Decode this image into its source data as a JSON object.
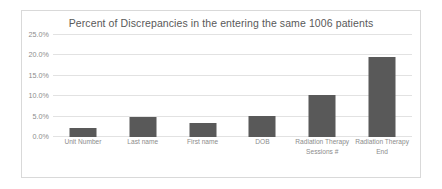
{
  "chart_data": {
    "type": "bar",
    "title": "Percent of Discrepancies in the entering the same 1006 patients",
    "xlabel": "",
    "ylabel": "",
    "categories": [
      "Unit Number",
      "Last name",
      "First name",
      "DOB",
      "Radiation Therapy Sessions #",
      "Radiation Therapy End"
    ],
    "category_lines": [
      [
        "Unit Number"
      ],
      [
        "Last name"
      ],
      [
        "First name"
      ],
      [
        "DOB"
      ],
      [
        "Radiation Therapy",
        "Sessions #"
      ],
      [
        "Radiation Therapy",
        "End"
      ]
    ],
    "values": [
      2.3,
      4.8,
      3.5,
      5.2,
      10.2,
      19.5
    ],
    "value_unit": "%",
    "ylim": [
      0,
      25
    ],
    "yticks": [
      0,
      5,
      10,
      15,
      20,
      25
    ],
    "ytick_labels": [
      "0.0%",
      "5.0%",
      "10.0%",
      "15.0%",
      "20.0%",
      "25.0%"
    ],
    "grid": true,
    "legend": false,
    "bar_color": "#595959",
    "gridline_color": "#e2e2e2",
    "title_color": "#595959",
    "tick_color": "#8c8c8c",
    "frame_color": "#d9d9d9",
    "background": "#ffffff"
  }
}
